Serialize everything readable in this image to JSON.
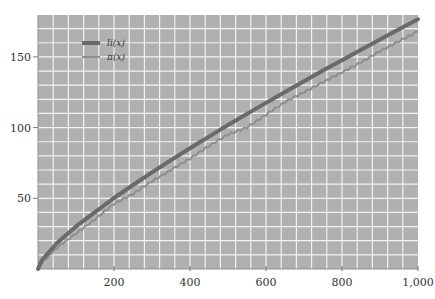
{
  "chart_data": {
    "type": "line",
    "title": "",
    "xlabel": "",
    "ylabel": "",
    "xlim": [
      0,
      1000
    ],
    "ylim": [
      0,
      180
    ],
    "grid": true,
    "legend_position": "upper-left",
    "x_ticks": [
      200,
      400,
      600,
      800,
      1000
    ],
    "x_tick_labels": [
      "200",
      "400",
      "600",
      "800",
      "1,000"
    ],
    "y_ticks": [
      50,
      100,
      150
    ],
    "y_tick_labels": [
      "50",
      "100",
      "150"
    ],
    "x_grid_step": 40,
    "y_grid_step": 10,
    "colors": {
      "background": "#b0b0b0",
      "grid": "#f2f2f2",
      "li": "#6a6a6a",
      "pi": "#8e8e8e"
    },
    "series": [
      {
        "name": "li(x)",
        "x": [
          0,
          10,
          50,
          100,
          150,
          200,
          250,
          300,
          350,
          400,
          450,
          500,
          550,
          600,
          650,
          700,
          750,
          800,
          850,
          900,
          950,
          1000
        ],
        "values": [
          0,
          6.2,
          18.4,
          30.1,
          40.2,
          50.2,
          59.4,
          68.3,
          77.0,
          85.4,
          93.6,
          101.8,
          109.7,
          117.5,
          125.2,
          132.8,
          140.3,
          147.7,
          155.0,
          162.3,
          169.5,
          176.6
        ]
      },
      {
        "name": "π(x)",
        "x": [
          0,
          10,
          50,
          100,
          150,
          200,
          250,
          300,
          350,
          400,
          450,
          500,
          550,
          600,
          650,
          700,
          750,
          800,
          850,
          900,
          950,
          1000
        ],
        "values": [
          0,
          4,
          15,
          25,
          35,
          46,
          53,
          62,
          70,
          78,
          87,
          95,
          100,
          109,
          118,
          125,
          132,
          139,
          146,
          154,
          161,
          168
        ]
      }
    ]
  },
  "legend": {
    "items": [
      {
        "label": "li(x)"
      },
      {
        "label": "π(x)"
      }
    ]
  }
}
